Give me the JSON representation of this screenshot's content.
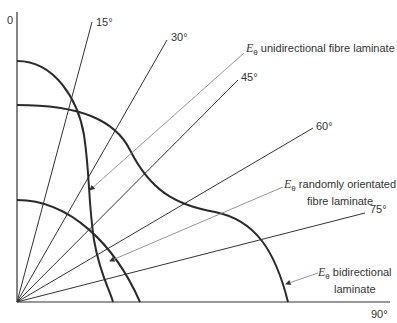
{
  "axes": {
    "y_top_label": "0",
    "x_end_label": "90°"
  },
  "angle_labels": [
    "15°",
    "30°",
    "45°",
    "60°",
    "75°"
  ],
  "curves": [
    {
      "symbol": "E",
      "subscript": "θ",
      "label": "unidirectional fibre laminate"
    },
    {
      "symbol": "E",
      "subscript": "θ",
      "label_line1": "randomly orientated",
      "label_line2": "fibre laminate"
    },
    {
      "symbol": "E",
      "subscript": "θ",
      "label_line1": "bidirectional",
      "label_line2": "laminate"
    }
  ],
  "colors": {
    "curve": "#2a2a2a",
    "line": "#333333",
    "leader": "#777777"
  }
}
